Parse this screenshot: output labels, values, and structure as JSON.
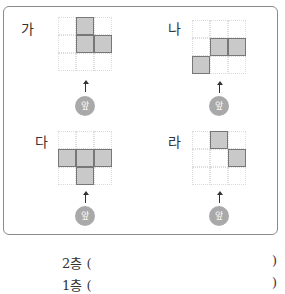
{
  "figures": [
    {
      "label": "가",
      "shaded": [
        [
          0,
          1
        ],
        [
          1,
          1
        ],
        [
          1,
          2
        ]
      ]
    },
    {
      "label": "나",
      "shaded": [
        [
          1,
          1
        ],
        [
          1,
          2
        ],
        [
          2,
          0
        ]
      ]
    },
    {
      "label": "다",
      "shaded": [
        [
          1,
          0
        ],
        [
          1,
          1
        ],
        [
          1,
          2
        ],
        [
          2,
          1
        ]
      ]
    },
    {
      "label": "라",
      "shaded": [
        [
          0,
          1
        ],
        [
          1,
          2
        ]
      ]
    }
  ],
  "front_label": "앞",
  "answers": [
    {
      "prefix": "2층 (",
      "suffix": ")"
    },
    {
      "prefix": "1층 (",
      "suffix": ")"
    }
  ]
}
